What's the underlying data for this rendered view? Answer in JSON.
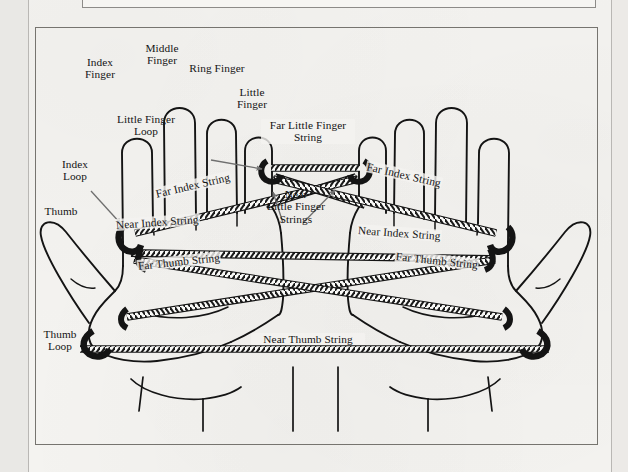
{
  "figure": {
    "caption": "",
    "background_color": "#f4f3f0",
    "ink_color": "#141414",
    "frame_color": "#76746f"
  },
  "labels": {
    "index_finger": {
      "lines": [
        "Index",
        "Finger"
      ]
    },
    "middle_finger": {
      "lines": [
        "Middle",
        "Finger"
      ]
    },
    "ring_finger": {
      "lines": [
        "Ring Finger"
      ]
    },
    "little_finger": {
      "lines": [
        "Little",
        "Finger"
      ]
    },
    "little_finger_loop": {
      "lines": [
        "Little Finger",
        "Loop"
      ]
    },
    "index_loop": {
      "lines": [
        "Index",
        "Loop"
      ]
    },
    "thumb": {
      "lines": [
        "Thumb"
      ]
    },
    "thumb_loop": {
      "lines": [
        "Thumb",
        "Loop"
      ]
    },
    "far_little_finger_string": {
      "lines": [
        "Far Little Finger",
        "String"
      ]
    },
    "near_little_finger_strings": {
      "lines": [
        "Near",
        "Little Finger",
        "Strings"
      ]
    },
    "far_index_string_left": {
      "lines": [
        "Far Index String"
      ]
    },
    "far_index_string_right": {
      "lines": [
        "Far Index String"
      ]
    },
    "near_index_string_left": {
      "lines": [
        "Near Index String"
      ]
    },
    "near_index_string_right": {
      "lines": [
        "Near Index String"
      ]
    },
    "far_thumb_string_left": {
      "lines": [
        "Far Thumb String"
      ]
    },
    "far_thumb_string_right": {
      "lines": [
        "Far Thumb String"
      ]
    },
    "near_thumb_string": {
      "lines": [
        "Near Thumb String"
      ]
    }
  }
}
